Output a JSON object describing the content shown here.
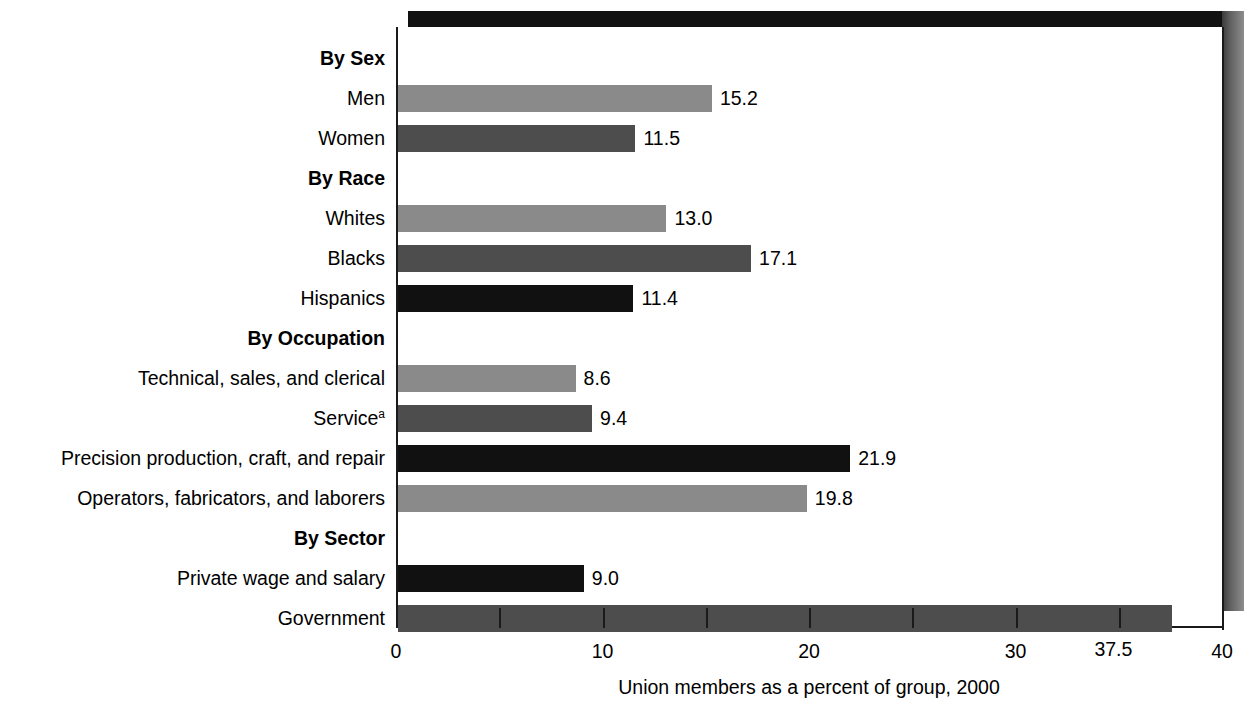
{
  "chart_data": {
    "type": "bar",
    "orientation": "horizontal",
    "title": "",
    "subtitle": "",
    "xlabel": "Union members as a percent of group, 2000",
    "ylabel": "",
    "xlim": [
      0,
      40
    ],
    "xticks": [
      0,
      10,
      20,
      30,
      40
    ],
    "xtick_labels": [
      "0",
      "10",
      "20",
      "30",
      "40"
    ],
    "minor_tick_step": 5,
    "grid": false,
    "legend": false,
    "footnote_marker": "a",
    "rows": [
      {
        "kind": "group",
        "label": "By Sex",
        "label_html": "By Sex"
      },
      {
        "kind": "bar",
        "label": "Men",
        "label_html": "Men",
        "value": 15.2,
        "value_label": "15.2",
        "fill": "light"
      },
      {
        "kind": "bar",
        "label": "Women",
        "label_html": "Women",
        "value": 11.5,
        "value_label": "11.5",
        "fill": "dark"
      },
      {
        "kind": "group",
        "label": "By Race",
        "label_html": "By Race"
      },
      {
        "kind": "bar",
        "label": "Whites",
        "label_html": "Whites",
        "value": 13.0,
        "value_label": "13.0",
        "fill": "light"
      },
      {
        "kind": "bar",
        "label": "Blacks",
        "label_html": "Blacks",
        "value": 17.1,
        "value_label": "17.1",
        "fill": "dark"
      },
      {
        "kind": "bar",
        "label": "Hispanics",
        "label_html": "Hispanics",
        "value": 11.4,
        "value_label": "11.4",
        "fill": "black"
      },
      {
        "kind": "group",
        "label": "By Occupation",
        "label_html": "By Occupation"
      },
      {
        "kind": "bar",
        "label": "Technical, sales, and clerical",
        "label_html": "Technical, sales, and clerical",
        "value": 8.6,
        "value_label": "8.6",
        "fill": "light"
      },
      {
        "kind": "bar",
        "label": "Service (a)",
        "label_html": "Service<sup>a</sup>",
        "value": 9.4,
        "value_label": "9.4",
        "fill": "dark"
      },
      {
        "kind": "bar",
        "label": "Precision production, craft, and repair",
        "label_html": "Precision production, craft, and repair",
        "value": 21.9,
        "value_label": "21.9",
        "fill": "black"
      },
      {
        "kind": "bar",
        "label": "Operators, fabricators, and laborers",
        "label_html": "Operators, fabricators, and laborers",
        "value": 19.8,
        "value_label": "19.8",
        "fill": "light"
      },
      {
        "kind": "group",
        "label": "By Sector",
        "label_html": "By Sector"
      },
      {
        "kind": "bar",
        "label": "Private wage and salary",
        "label_html": "Private wage and salary",
        "value": 9.0,
        "value_label": "9.0",
        "fill": "black"
      },
      {
        "kind": "bar",
        "label": "Government",
        "label_html": "Government",
        "value": 37.5,
        "value_label": "37.5",
        "fill": "dark",
        "value_below": true
      }
    ],
    "colors": {
      "fill_light": "#8a8a8a",
      "fill_dark": "#4d4d4d",
      "fill_black": "#111111",
      "axis": "#1a1a1a",
      "background": "#ffffff",
      "shadow_top": "#111111",
      "shadow_right": "#5e5e5e"
    }
  }
}
